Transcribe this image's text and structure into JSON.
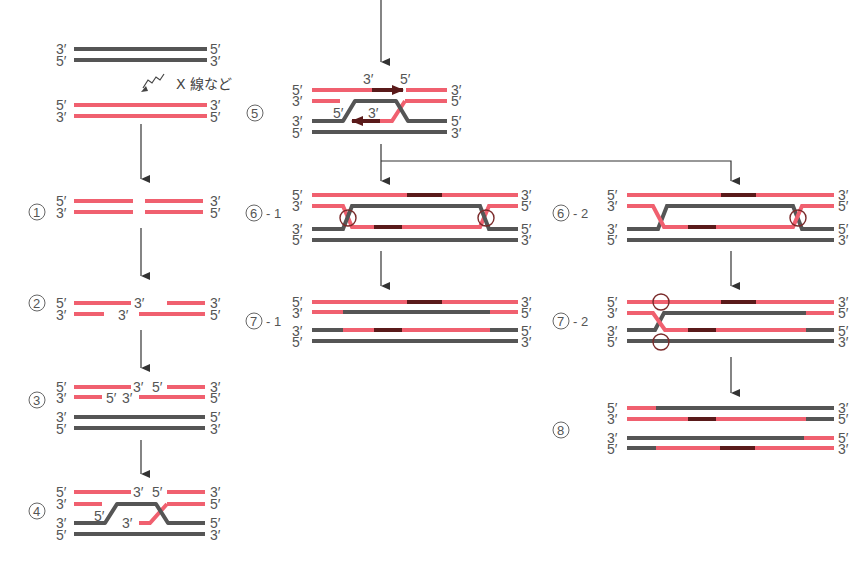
{
  "colors": {
    "template_strand": "#555555",
    "damaged_strand": "#f0606f",
    "new_synthesis": "#5a1a1a",
    "text": "#555555",
    "arrow": "#333333",
    "crossing_mark": "#7a2a2a"
  },
  "annotation": {
    "xray": "X 線など"
  },
  "steps": [
    {
      "id": "s0",
      "label": ""
    },
    {
      "id": "s1",
      "label": "1"
    },
    {
      "id": "s2",
      "label": "2"
    },
    {
      "id": "s3",
      "label": "3"
    },
    {
      "id": "s4",
      "label": "4"
    },
    {
      "id": "s5",
      "label": "5"
    },
    {
      "id": "s6_1",
      "label": "6",
      "suffix": "- 1"
    },
    {
      "id": "s6_2",
      "label": "6",
      "suffix": "- 2"
    },
    {
      "id": "s7_1",
      "label": "7",
      "suffix": "- 1"
    },
    {
      "id": "s7_2",
      "label": "7",
      "suffix": "- 2"
    },
    {
      "id": "s8",
      "label": "8"
    }
  ],
  "end_labels": {
    "p5": "5′",
    "p3": "3′"
  },
  "lines": {
    "s0_gray": [
      {
        "x1": 73,
        "x2": 207,
        "y": 49,
        "left": "3′",
        "right": "5′",
        "color": "gray"
      },
      {
        "x1": 73,
        "x2": 207,
        "y": 60,
        "left": "5′",
        "right": "3′",
        "color": "gray"
      }
    ],
    "s0_pink": [
      {
        "x1": 73,
        "x2": 207,
        "y": 105,
        "left": "5′",
        "right": "3′",
        "color": "pink"
      },
      {
        "x1": 73,
        "x2": 207,
        "y": 116,
        "left": "3′",
        "right": "5′",
        "color": "pink"
      }
    ]
  },
  "footer_text": ""
}
